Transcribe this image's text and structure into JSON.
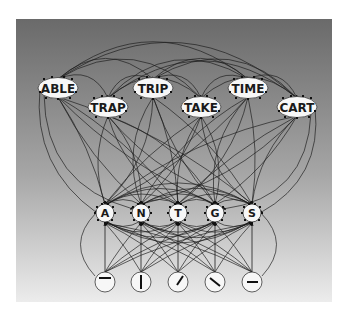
{
  "diagram": {
    "title": "",
    "panel": {
      "x": 16,
      "y": 19,
      "w": 316,
      "h": 283,
      "top_color": "#6a6a6a",
      "mid_color": "#a6a6a6",
      "bottom_color": "#ececec"
    },
    "colors": {
      "edge": "#1c1c1c",
      "node_fill": "#f7f7f7",
      "node_stroke": "#3a3a3a",
      "text": "#1a1a1a"
    },
    "word_nodes": [
      {
        "id": "ABLE",
        "label": "ABLE",
        "x": 58,
        "y": 88
      },
      {
        "id": "TRAP",
        "label": "TRAP",
        "x": 108,
        "y": 107
      },
      {
        "id": "TRIP",
        "label": "TRIP",
        "x": 153,
        "y": 88
      },
      {
        "id": "TAKE",
        "label": "TAKE",
        "x": 201,
        "y": 107
      },
      {
        "id": "TIME",
        "label": "TIME",
        "x": 248,
        "y": 88
      },
      {
        "id": "CART",
        "label": "CART",
        "x": 297,
        "y": 107
      }
    ],
    "letter_nodes": [
      {
        "id": "A",
        "label": "A",
        "x": 105,
        "y": 213
      },
      {
        "id": "N",
        "label": "N",
        "x": 141,
        "y": 213
      },
      {
        "id": "T",
        "label": "T",
        "x": 178,
        "y": 213
      },
      {
        "id": "G",
        "label": "G",
        "x": 215,
        "y": 213
      },
      {
        "id": "S",
        "label": "S",
        "x": 252,
        "y": 213
      }
    ],
    "feature_nodes": [
      {
        "id": "f-horizontal-top",
        "glyph": "horizontal-bar-icon",
        "x": 105,
        "y": 282,
        "angle": 0,
        "offset_y": -4
      },
      {
        "id": "f-vertical",
        "glyph": "vertical-bar-icon",
        "x": 141,
        "y": 282,
        "angle": 90,
        "offset_y": 0
      },
      {
        "id": "f-diagonal-right",
        "glyph": "diagonal-right-icon",
        "x": 178,
        "y": 282,
        "angle": -55,
        "offset_y": 0
      },
      {
        "id": "f-diagonal-left",
        "glyph": "diagonal-left-icon",
        "x": 215,
        "y": 282,
        "angle": 35,
        "offset_y": 0
      },
      {
        "id": "f-horizontal-mid",
        "glyph": "horizontal-mid-icon",
        "x": 252,
        "y": 282,
        "angle": 0,
        "offset_y": 0
      }
    ],
    "layers": [
      "word",
      "letter",
      "feature"
    ]
  }
}
